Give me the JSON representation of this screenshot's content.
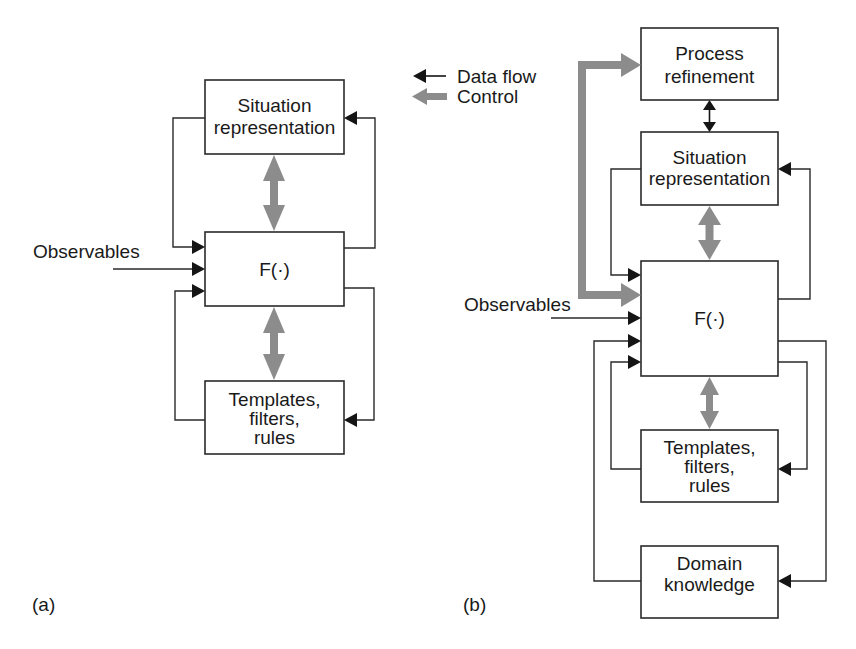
{
  "legend": {
    "data_flow_label": "Data flow",
    "control_label": "Control",
    "data_flow_color": "#151515",
    "control_color": "#8c8c8c"
  },
  "diagram_a": {
    "caption": "(a)",
    "observables_label": "Observables",
    "boxes": {
      "situation": [
        "Situation",
        "representation"
      ],
      "function": "F(·)",
      "templates": [
        "Templates,",
        "filters,",
        "rules"
      ]
    }
  },
  "diagram_b": {
    "caption": "(b)",
    "observables_label": "Observables",
    "boxes": {
      "process": [
        "Process",
        "refinement"
      ],
      "situation": [
        "Situation",
        "representation"
      ],
      "function": "F(·)",
      "templates": [
        "Templates,",
        "filters,",
        "rules"
      ],
      "domain": [
        "Domain",
        "knowledge"
      ]
    }
  }
}
